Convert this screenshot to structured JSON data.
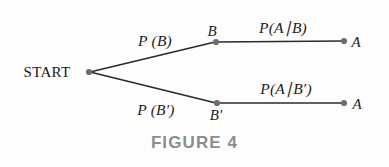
{
  "figure": {
    "caption": "FIGURE 4",
    "type": "probability-tree-diagram",
    "background_color": "#fdfdfd",
    "line_color": "#2b2b2b",
    "node_color": "#6e6e6e",
    "caption_color": "#8d8d8d",
    "text_color": "#1c1c1c"
  },
  "nodes": {
    "start": {
      "label": "START",
      "x": 89,
      "y": 72
    },
    "b": {
      "label": "B",
      "x": 216,
      "y": 42
    },
    "b_prime": {
      "label": "B′",
      "x": 217,
      "y": 103
    },
    "a_upper": {
      "label": "A",
      "x": 344,
      "y": 41
    },
    "a_lower": {
      "label": "A",
      "x": 344,
      "y": 103
    }
  },
  "edges": {
    "start_to_b": {
      "label": "P (B)",
      "x": 155,
      "y": 41
    },
    "start_to_b_prime": {
      "label": "P (B′)",
      "x": 155,
      "y": 110
    },
    "b_to_a": {
      "label": "P(A∣B)",
      "x": 283,
      "y": 28
    },
    "b_prime_to_a": {
      "label": "P(A∣B′)",
      "x": 285,
      "y": 89
    }
  },
  "math_labels": {
    "p_b": {
      "p": "P",
      "open": "(",
      "arg": "B",
      "close": ")"
    },
    "p_b_prime": {
      "p": "P",
      "open": "(",
      "arg": "B",
      "prime": "′",
      "close": ")"
    },
    "p_a_given_b": {
      "p": "P",
      "open": "(",
      "a": "A",
      "bar": "∣",
      "b": "B",
      "close": ")"
    },
    "p_a_given_b_prime": {
      "p": "P",
      "open": "(",
      "a": "A",
      "bar": "∣",
      "b": "B",
      "prime": "′",
      "close": ")"
    }
  }
}
